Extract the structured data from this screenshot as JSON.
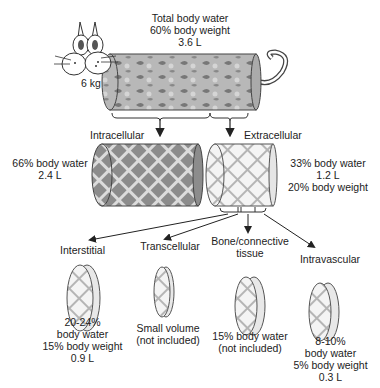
{
  "top": {
    "title_line1": "Total body water",
    "title_line2": "60% body weight",
    "title_line3": "3.6 L",
    "cat_weight": "6 kg"
  },
  "compartments": {
    "intracellular": {
      "label": "Intracellular",
      "line1": "66% body water",
      "line2": "2.4 L"
    },
    "extracellular": {
      "label": "Extracellular",
      "line1": "33% body water",
      "line2": "1.2 L",
      "line3": "20% body weight"
    }
  },
  "subcompartments": [
    {
      "label": "Interstitial",
      "label2": "",
      "line1": "20-24%",
      "line2": "body water",
      "line3": "15% body weight",
      "line4": "0.9 L"
    },
    {
      "label": "Transcellular",
      "label2": "",
      "line1": "Small volume",
      "line2": "(not included)",
      "line3": "",
      "line4": ""
    },
    {
      "label": "Bone/connective",
      "label2": "tissue",
      "line1": "15% body water",
      "line2": "(not included)",
      "line3": "",
      "line4": ""
    },
    {
      "label": "Intravascular",
      "label2": "",
      "line1": "8-10%",
      "line2": "body water",
      "line3": "5% body weight",
      "line4": "0.3 L"
    }
  ],
  "colors": {
    "dark_fill": "#8a8a8a",
    "light_fill": "#f0f0f0",
    "stroke": "#444444"
  }
}
